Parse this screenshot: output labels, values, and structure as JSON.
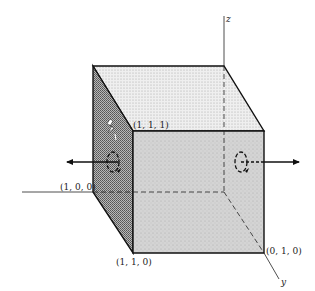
{
  "diagram": {
    "type": "unit-cube-flux",
    "axes": {
      "z_label": "z",
      "y_label": "y"
    },
    "vertices": {
      "v111": "(1, 1, 1)",
      "v100": "(1, 0, 0)",
      "v110": "(1, 1, 0)",
      "v010": "(0, 1, 0)"
    },
    "colors": {
      "outline": "#111111",
      "top_face": "#e8e8e8",
      "front_face": "#cfcfcf",
      "left_face": "#8f8f8f",
      "background": "#ffffff"
    }
  }
}
